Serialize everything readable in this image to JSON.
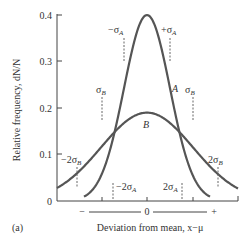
{
  "chart_data": {
    "type": "line",
    "title": "",
    "panel_label": "(a)",
    "xlabel": "Deviation from mean, x−μ",
    "ylabel": "Relative frequency, dN/N",
    "ylim": [
      0,
      0.4
    ],
    "yticks": [
      "0",
      "0.1",
      "0.2",
      "0.3",
      "0.4"
    ],
    "xticks": {
      "minus": "−",
      "zero": "0",
      "plus": "+"
    },
    "grid": false,
    "series": [
      {
        "name": "A",
        "sigma_relative": 1.0,
        "peak": 0.4,
        "color": "#555555",
        "markers": [
          "−σA",
          "+σA",
          "−2σA",
          "2σA"
        ]
      },
      {
        "name": "B",
        "sigma_relative": 2.0,
        "peak": 0.19,
        "color": "#555555",
        "markers": [
          "σB",
          "σB",
          "−2σB",
          "2σB"
        ]
      }
    ],
    "annotations": {
      "minus_sigma_a": "−σ",
      "plus_sigma_a": "+σ",
      "sub_a": "A",
      "sub_b": "B",
      "sigma_b": "σ",
      "minus_2sigma_b": "−2σ",
      "two_sigma_b": "2σ",
      "minus_2sigma_a": "−2σ",
      "two_sigma_a": "2σ",
      "curve_a_label": "A",
      "curve_b_label": "B"
    }
  }
}
